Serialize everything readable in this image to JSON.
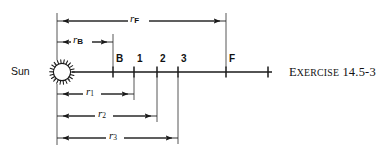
{
  "figure": {
    "caption": {
      "word_first_letter": "E",
      "word_rest": "XERCISE",
      "number": "14.5-3",
      "full": "Exercise 14.5-3"
    },
    "body_color": "#1a1a1a",
    "background_color": "#ffffff"
  },
  "axis": {
    "name": "radial-distance-axis",
    "start_x": 72,
    "end_x": 272,
    "y": 72,
    "origin_label": "Sun"
  },
  "tick_marks": [
    {
      "id": "B",
      "label": "B",
      "x": 113
    },
    {
      "id": "1",
      "label": "1",
      "x": 134
    },
    {
      "id": "2",
      "label": "2",
      "x": 157
    },
    {
      "id": "3",
      "label": "3",
      "x": 178
    },
    {
      "id": "F",
      "label": "F",
      "x": 226
    },
    {
      "id": "end",
      "label": "",
      "x": 268
    }
  ],
  "dimensions": [
    {
      "id": "rF",
      "symbol": "r",
      "subscript": "F",
      "subscript_style": "letter",
      "label": "rF",
      "from_x": 57,
      "to_x": 226,
      "y": 21,
      "label_x": 136,
      "label_y": 13
    },
    {
      "id": "rB",
      "symbol": "r",
      "subscript": "B",
      "subscript_style": "letter",
      "label": "rB",
      "from_x": 57,
      "to_x": 113,
      "y": 42,
      "label_x": 79,
      "label_y": 34
    },
    {
      "id": "r1",
      "symbol": "r",
      "subscript": "1",
      "subscript_style": "number",
      "label": "r1",
      "from_x": 57,
      "to_x": 134,
      "y": 94,
      "label_x": 89,
      "label_y": 86
    },
    {
      "id": "r2",
      "symbol": "r",
      "subscript": "2",
      "subscript_style": "number",
      "label": "r2",
      "from_x": 57,
      "to_x": 157,
      "y": 116,
      "label_x": 101,
      "label_y": 108
    },
    {
      "id": "r3",
      "symbol": "r",
      "subscript": "3",
      "subscript_style": "number",
      "label": "r3",
      "from_x": 57,
      "to_x": 178,
      "y": 138,
      "label_x": 112,
      "label_y": 130
    }
  ],
  "sun": {
    "label": "Sun",
    "center_x": 62,
    "center_y": 72,
    "radius": 11,
    "spikes": 22
  }
}
